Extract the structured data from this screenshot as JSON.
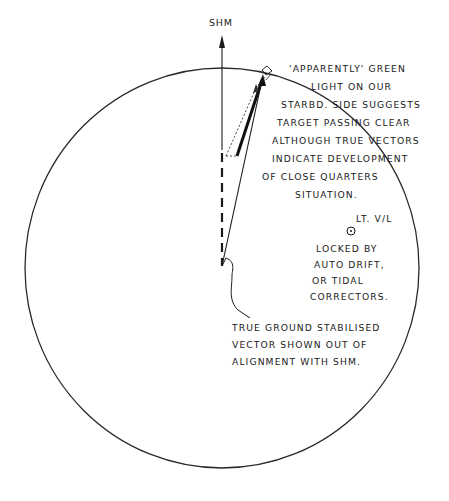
{
  "diagram": {
    "type": "radar plot diagram (sketch)",
    "heading_marker": {
      "label": "SHM",
      "meaning": "ship's head marker"
    },
    "annotations": {
      "green_light": [
        "'APPARENTLY' GREEN",
        "LIGHT ON OUR",
        "STARBD. SIDE SUGGESTS",
        "TARGET PASSING CLEAR",
        "ALTHOUGH TRUE VECTORS",
        "INDICATE DEVELOPMENT",
        "OF CLOSE QUARTERS",
        "SITUATION."
      ],
      "light_vessel": {
        "label": "LT. V/L"
      },
      "locked": [
        "LOCKED BY",
        "AUTO DRIFT,",
        "OR TIDAL",
        "CORRECTORS."
      ],
      "true_ground": [
        "TRUE GROUND STABILISED",
        "VECTOR SHOWN OUT OF",
        "ALIGNMENT WITH SHM."
      ]
    },
    "colors": {
      "ink": "#1a1a1a",
      "background": "#ffffff"
    }
  }
}
